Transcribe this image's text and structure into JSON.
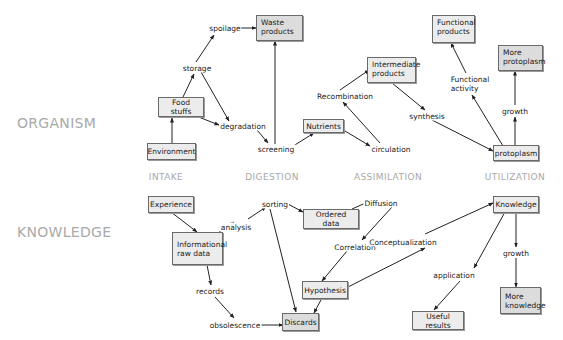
{
  "rows": {
    "organism": "ORGANISM",
    "knowledge": "KNOWLEDGE"
  },
  "columns": [
    "INTAKE",
    "DIGESTION",
    "ASSIMILATION",
    "UTILIZATION"
  ],
  "organism": {
    "boxes": {
      "environment": "Environment",
      "food_stuffs": "Food stuffs",
      "waste_products": "Waste\nproducts",
      "nutrients": "Nutrients",
      "intermediate_products": "Intermediate\nproducts",
      "functional_products": "Functional\nproducts",
      "more_protoplasm": "More\nprotoplasm",
      "protoplasm": "protoplasm"
    },
    "processes": {
      "spoilage": "spoilage",
      "storage": "storage",
      "degradation": "degradation",
      "screening": "screening",
      "recombination": "Recombination",
      "circulation": "circulation",
      "synthesis": "synthesis",
      "functional_activity": "Functional\nactivity",
      "growth": "growth"
    }
  },
  "knowledge": {
    "boxes": {
      "experience": "Experience",
      "informational_raw_data": "Informational\nraw data",
      "ordered_data": "Ordered data",
      "hypothesis": "Hypothesis",
      "discards": "Discards",
      "knowledge": "Knowledge",
      "useful_results": "Useful results",
      "more_knowledge": "More\nknowledge"
    },
    "processes": {
      "analysis": "analysis",
      "sorting": "sorting",
      "diffusion": "Diffusion",
      "correlation": "Correlation",
      "conceptualization": "Conceptualization",
      "records": "records",
      "obsolescence": "obsolescence",
      "application": "application",
      "growth": "growth"
    }
  },
  "colors": {
    "label_gray": "#a9a9a9",
    "box_fill": "#ececec",
    "box_fill_dark": "#dcdcdc",
    "line": "#222222"
  }
}
